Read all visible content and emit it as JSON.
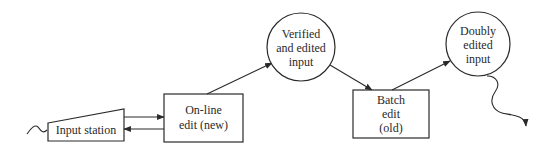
{
  "diagram": {
    "type": "data-flow",
    "nodes": [
      {
        "id": "input_station",
        "shape": "trapezoid",
        "label": [
          "Input station"
        ]
      },
      {
        "id": "online_edit",
        "shape": "rectangle",
        "label": [
          "On-line",
          "edit (new)"
        ]
      },
      {
        "id": "verified_input",
        "shape": "circle",
        "label": [
          "Verified",
          "and edited",
          "input"
        ]
      },
      {
        "id": "batch_edit",
        "shape": "rectangle",
        "label": [
          "Batch",
          "edit",
          "(old)"
        ]
      },
      {
        "id": "doubly_edited",
        "shape": "circle",
        "label": [
          "Doubly",
          "edited",
          "input"
        ]
      }
    ],
    "edges": [
      {
        "from": "external",
        "to": "input_station",
        "style": "wavy"
      },
      {
        "from": "input_station",
        "to": "online_edit",
        "style": "arrow"
      },
      {
        "from": "online_edit",
        "to": "input_station",
        "style": "arrow"
      },
      {
        "from": "online_edit",
        "to": "verified_input",
        "style": "arrow"
      },
      {
        "from": "verified_input",
        "to": "batch_edit",
        "style": "arrow"
      },
      {
        "from": "batch_edit",
        "to": "doubly_edited",
        "style": "arrow"
      },
      {
        "from": "doubly_edited",
        "to": "external",
        "style": "wavy-arrow"
      }
    ]
  },
  "labels": {
    "input_station": "Input station",
    "online_edit_1": "On-line",
    "online_edit_2": "edit (new)",
    "verified_1": "Verified",
    "verified_2": "and edited",
    "verified_3": "input",
    "batch_1": "Batch",
    "batch_2": "edit",
    "batch_3": "(old)",
    "doubly_1": "Doubly",
    "doubly_2": "edited",
    "doubly_3": "input"
  },
  "colors": {
    "ink": "#2a2a2a",
    "background": "#ffffff"
  }
}
